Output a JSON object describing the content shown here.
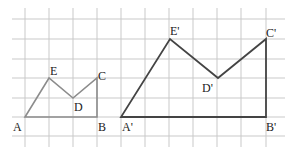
{
  "diagram": {
    "type": "grid-dilation",
    "grid": {
      "x_lines": [
        25,
        49,
        73,
        97,
        121,
        145,
        169,
        193,
        217,
        241,
        266
      ],
      "y_lines": [
        19,
        39,
        59,
        78,
        98,
        117,
        136
      ],
      "x_extent": [
        12,
        285
      ],
      "y_extent": [
        8,
        147
      ],
      "color": "#c9c9c9"
    },
    "small_figure": {
      "name": "ABCDE",
      "color": "#8c8c8c",
      "points": {
        "A": [
          25,
          117
        ],
        "B": [
          97,
          117
        ],
        "C": [
          97,
          78
        ],
        "D": [
          73,
          98
        ],
        "E": [
          49,
          78
        ]
      },
      "labels": [
        {
          "text": "A",
          "x": 13,
          "y": 131
        },
        {
          "text": "B",
          "x": 98,
          "y": 131
        },
        {
          "text": "C",
          "x": 98,
          "y": 80
        },
        {
          "text": "D",
          "x": 74,
          "y": 111
        },
        {
          "text": "E",
          "x": 50,
          "y": 75
        }
      ]
    },
    "large_figure": {
      "name": "A'B'C'D'E'",
      "color": "#444444",
      "points": {
        "A'": [
          121,
          117
        ],
        "B'": [
          266,
          117
        ],
        "C'": [
          266,
          39
        ],
        "D'": [
          218,
          78
        ],
        "E'": [
          170,
          39
        ]
      },
      "labels": [
        {
          "text": "A'",
          "x": 122,
          "y": 131
        },
        {
          "text": "B'",
          "x": 266,
          "y": 131
        },
        {
          "text": "C'",
          "x": 266,
          "y": 37
        },
        {
          "text": "D'",
          "x": 202,
          "y": 92
        },
        {
          "text": "E'",
          "x": 170,
          "y": 35
        }
      ]
    }
  }
}
